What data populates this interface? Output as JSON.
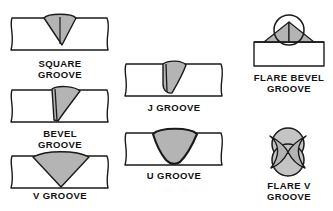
{
  "diagram": {
    "style": {
      "plate_fill": "#ffffff",
      "bead_fill": "#b4b4b4",
      "bead_fill_light": "#c4c4c4",
      "line_color": "#1a1a1a",
      "background": "#ffffff",
      "label_color": "#111111"
    },
    "figures": [
      {
        "id": "square-groove",
        "label": "SQUARE\nGROOVE",
        "label_lines": [
          "SQUARE",
          "GROOVE"
        ],
        "column": "left",
        "row": 1,
        "joint_kind": "plate-band",
        "bead_shape": "narrow-v-pointed",
        "has_center_line": true
      },
      {
        "id": "bevel-groove",
        "label": "BEVEL\nGROOVE",
        "label_lines": [
          "BEVEL",
          "GROOVE"
        ],
        "column": "left",
        "row": 2,
        "joint_kind": "plate-band",
        "bead_shape": "asymmetric-bevel",
        "has_center_line": true
      },
      {
        "id": "v-groove",
        "label": "V GROOVE",
        "label_lines": [
          "V GROOVE"
        ],
        "column": "left",
        "row": 3,
        "joint_kind": "plate-band",
        "bead_shape": "wide-v",
        "has_center_line": false
      },
      {
        "id": "j-groove",
        "label": "J GROOVE",
        "label_lines": [
          "J GROOVE"
        ],
        "column": "middle",
        "row": 1,
        "joint_kind": "plate-band",
        "bead_shape": "j-curved",
        "has_center_line": true
      },
      {
        "id": "u-groove",
        "label": "U GROOVE",
        "label_lines": [
          "U GROOVE"
        ],
        "column": "middle",
        "row": 2,
        "joint_kind": "plate-band",
        "bead_shape": "u-rounded",
        "has_center_line": false
      },
      {
        "id": "flare-bevel-groove",
        "label": "FLARE BEVEL\nGROOVE",
        "label_lines": [
          "FLARE BEVEL",
          "GROOVE"
        ],
        "column": "right",
        "row": 1,
        "joint_kind": "round-bar-on-plate",
        "bead_shape": "twin-fillet-triangles",
        "has_center_line": false
      },
      {
        "id": "flare-v-groove",
        "label": "FLARE V\nGROOVE",
        "label_lines": [
          "FLARE V",
          "GROOVE"
        ],
        "column": "right",
        "row": 2,
        "joint_kind": "two-round-bars",
        "bead_shape": "bowtie-x",
        "has_center_line": false
      }
    ]
  }
}
